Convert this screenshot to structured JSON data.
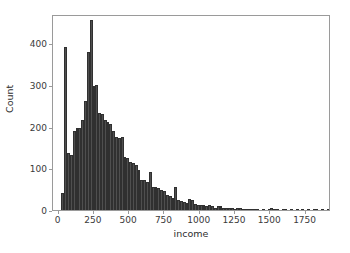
{
  "chart_data": {
    "type": "bar",
    "subtype": "histogram",
    "title": "",
    "xlabel": "income",
    "ylabel": "Count",
    "xlim": [
      -40,
      1930
    ],
    "ylim": [
      0,
      470
    ],
    "grid": false,
    "legend": null,
    "bin_width": 20,
    "xticks": [
      0,
      250,
      500,
      750,
      1000,
      1250,
      1500,
      1750
    ],
    "xticklabels": [
      "0",
      "250",
      "500",
      "750",
      "1000",
      "1250",
      "1500",
      "1750"
    ],
    "yticks": [
      0,
      100,
      200,
      300,
      400
    ],
    "yticklabels": [
      "0",
      "100",
      "200",
      "300",
      "400"
    ],
    "bar_color": "#4f4f4f",
    "edge_color": "#303030",
    "frame_color": "#9a9a9a",
    "bin_starts": [
      20,
      40,
      60,
      80,
      100,
      120,
      140,
      160,
      180,
      200,
      220,
      240,
      260,
      280,
      300,
      320,
      340,
      360,
      380,
      400,
      420,
      440,
      460,
      480,
      500,
      520,
      540,
      560,
      580,
      600,
      620,
      640,
      660,
      680,
      700,
      720,
      740,
      760,
      780,
      800,
      820,
      840,
      860,
      880,
      900,
      920,
      940,
      960,
      980,
      1000,
      1020,
      1040,
      1060,
      1080,
      1100,
      1120,
      1140,
      1160,
      1180,
      1200,
      1220,
      1240,
      1260,
      1280,
      1300,
      1320,
      1340,
      1360,
      1380,
      1400,
      1420,
      1440,
      1460,
      1480,
      1500,
      1520,
      1540,
      1560,
      1580,
      1600,
      1620,
      1640,
      1660,
      1680,
      1700,
      1720,
      1740,
      1760,
      1780,
      1800,
      1820,
      1840,
      1860,
      1880,
      1900
    ],
    "values": [
      40,
      390,
      136,
      133,
      190,
      196,
      196,
      217,
      262,
      380,
      455,
      298,
      300,
      233,
      230,
      215,
      211,
      206,
      190,
      175,
      173,
      174,
      128,
      124,
      116,
      112,
      108,
      96,
      73,
      72,
      66,
      92,
      55,
      55,
      53,
      48,
      46,
      37,
      33,
      30,
      56,
      23,
      21,
      20,
      18,
      26,
      24,
      14,
      11,
      11,
      12,
      10,
      13,
      10,
      6,
      10,
      9,
      4,
      5,
      5,
      4,
      3,
      6,
      4,
      2,
      2,
      1,
      2,
      1,
      2,
      0,
      1,
      0,
      1,
      4,
      3,
      1,
      0,
      2,
      1,
      0,
      1,
      0,
      1,
      0,
      1,
      0,
      1,
      0,
      1,
      1,
      0,
      1,
      0,
      1
    ]
  }
}
